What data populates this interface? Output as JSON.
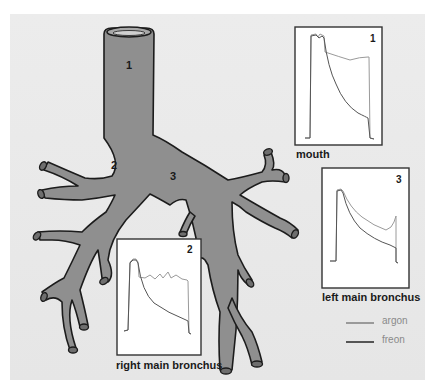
{
  "diagram": {
    "region_labels": [
      {
        "id": "1",
        "text": "1"
      },
      {
        "id": "2",
        "text": "2"
      },
      {
        "id": "3",
        "text": "3"
      }
    ],
    "traces": [
      {
        "id": "1",
        "number": "1",
        "caption": "mouth"
      },
      {
        "id": "2",
        "number": "2",
        "caption": "right main bronchus"
      },
      {
        "id": "3",
        "number": "3",
        "caption": "left main bronchus"
      }
    ],
    "legend": [
      {
        "label": "argon",
        "color": "#9a9a9a"
      },
      {
        "label": "freon",
        "color": "#555555"
      }
    ],
    "colors": {
      "airway_fill": "#8f8f8f",
      "airway_outline": "#1c1c1c",
      "panel_bg": "#e9e9e9"
    }
  }
}
